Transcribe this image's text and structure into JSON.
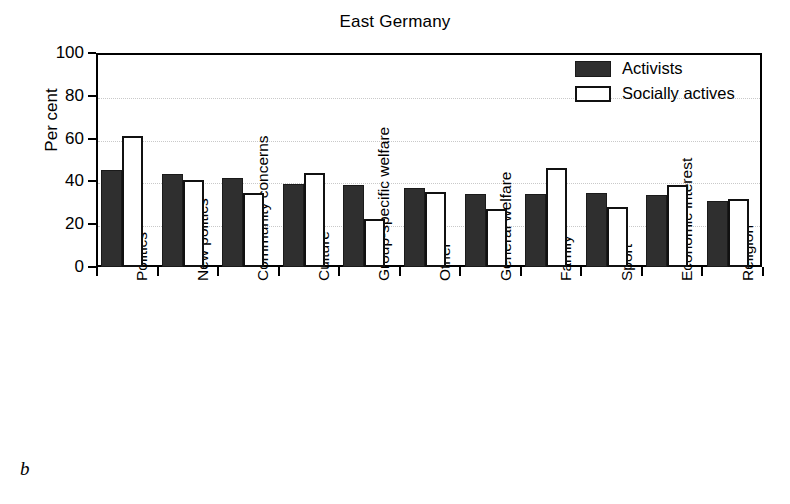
{
  "figure": {
    "panel_letter": "b",
    "title": "East Germany"
  },
  "legend": {
    "position": "top-right-inside",
    "items": [
      {
        "label": "Activists",
        "color": "#2f2f2f",
        "swatch": "filled-dark-square"
      },
      {
        "label": "Socially actives",
        "color": "#ffffff",
        "swatch": "open-white-square"
      }
    ]
  },
  "axes": {
    "ylabel": "Per cent",
    "yticks": [
      "0",
      "20",
      "40",
      "60",
      "80",
      "100"
    ],
    "ymin": 0,
    "ymax": 100
  },
  "chart_data": {
    "type": "bar",
    "title": "East Germany",
    "xlabel": "",
    "ylabel": "Per cent",
    "ylim": [
      0,
      100
    ],
    "yticks": [
      0,
      20,
      40,
      60,
      80,
      100
    ],
    "grid": "horizontal-dotted",
    "legend_position": "upper right",
    "categories": [
      "Politics",
      "New politics",
      "Community concerns",
      "Culture",
      "Group-specific welfare",
      "Other",
      "General welfare",
      "Family",
      "Sport",
      "Economic interest",
      "Religion"
    ],
    "series": [
      {
        "name": "Activists",
        "color": "#2f2f2f",
        "values": [
          45.5,
          43.5,
          41.5,
          39,
          38.5,
          37,
          34,
          34,
          34.5,
          33.5,
          31
        ]
      },
      {
        "name": "Socially actives",
        "color": "#ffffff",
        "values": [
          61,
          40.5,
          34.5,
          44,
          22.5,
          35,
          27,
          46.5,
          28,
          38.5,
          32
        ]
      }
    ]
  }
}
